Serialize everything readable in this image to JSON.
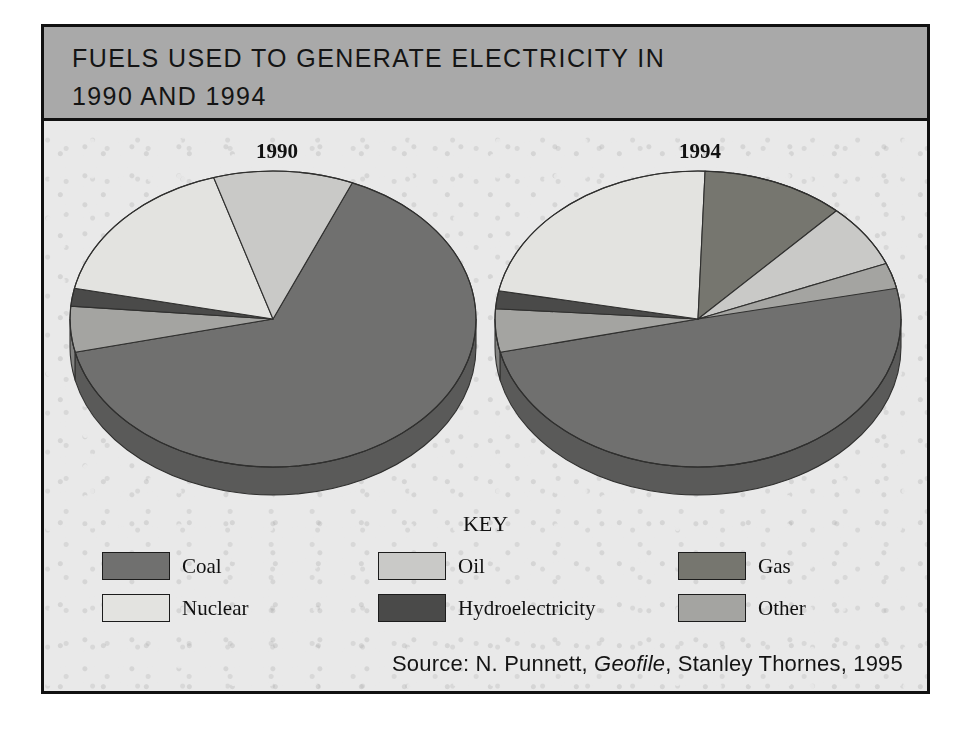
{
  "figure": {
    "title_line_1": "FUELS USED TO GENERATE ELECTRICITY IN",
    "title_line_2": "1990 AND 1994",
    "key_title": "KEY",
    "source_prefix": "Source: N. Punnett, ",
    "source_italic": "Geofile",
    "source_suffix": ", Stanley Thornes, 1995",
    "banner_color": "#a9a9a9",
    "background_color": "#e9e9e9",
    "border_color": "#111111"
  },
  "legend": {
    "entries": [
      {
        "label": "Coal",
        "color": "#70706f"
      },
      {
        "label": "Oil",
        "color": "#c9c9c7"
      },
      {
        "label": "Gas",
        "color": "#76766f"
      },
      {
        "label": "Nuclear",
        "color": "#e3e3e0"
      },
      {
        "label": "Hydroelectricity",
        "color": "#4a4a49"
      },
      {
        "label": "Other",
        "color": "#a4a4a1"
      }
    ]
  },
  "chart_data": {
    "type": "pie",
    "title": "FUELS USED TO GENERATE ELECTRICITY IN 1990 AND 1994",
    "source": "Source: N. Punnett, Geofile, Stanley Thornes, 1995",
    "legend_position": "bottom",
    "categories": [
      "Coal",
      "Oil",
      "Gas",
      "Nuclear",
      "Hydroelectricity",
      "Other"
    ],
    "colors": [
      "#70706f",
      "#c9c9c7",
      "#76766f",
      "#e3e3e0",
      "#4a4a49",
      "#a4a4a1"
    ],
    "units": "percent",
    "charts": [
      {
        "name": "1990",
        "label": "1990",
        "slices": [
          {
            "category": "Coal",
            "value": 65
          },
          {
            "category": "Oil",
            "value": 11
          },
          {
            "category": "Gas",
            "value": 0
          },
          {
            "category": "Nuclear",
            "value": 17
          },
          {
            "category": "Hydroelectricity",
            "value": 2
          },
          {
            "category": "Other",
            "value": 5
          }
        ]
      },
      {
        "name": "1994",
        "label": "1994",
        "slices": [
          {
            "category": "Coal",
            "value": 52
          },
          {
            "category": "Other",
            "value": 2
          },
          {
            "category": "Oil",
            "value": 9
          },
          {
            "category": "Gas",
            "value": 11
          },
          {
            "category": "Nuclear",
            "value": 24
          },
          {
            "category": "Hydroelectricity",
            "value": 2
          }
        ]
      }
    ]
  },
  "pies": {
    "p1990": {
      "label": "1990",
      "slices": [
        {
          "name": "coal",
          "color": "#70706f",
          "start": -67,
          "end": 167
        },
        {
          "name": "other",
          "color": "#a4a4a1",
          "start": 167,
          "end": 185
        },
        {
          "name": "hydro",
          "color": "#4a4a49",
          "start": 185,
          "end": 192
        },
        {
          "name": "nuclear",
          "color": "#e3e3e0",
          "start": 192,
          "end": 253
        },
        {
          "name": "oil",
          "color": "#c9c9c7",
          "start": 253,
          "end": 293
        }
      ]
    },
    "p1994": {
      "label": "1994",
      "slices": [
        {
          "name": "coal",
          "color": "#70706f",
          "start": -80,
          "end": 167
        },
        {
          "name": "other",
          "color": "#a4a4a1",
          "start": 167,
          "end": 184
        },
        {
          "name": "hydro",
          "color": "#4a4a49",
          "start": 184,
          "end": 191
        },
        {
          "name": "nuclear",
          "color": "#e3e3e0",
          "start": 191,
          "end": 272
        },
        {
          "name": "gas",
          "color": "#76766f",
          "start": 272,
          "end": 313
        },
        {
          "name": "oil",
          "color": "#c9c9c7",
          "start": 313,
          "end": 338
        },
        {
          "name": "other2",
          "color": "#a4a4a1",
          "start": 338,
          "end": 348
        }
      ]
    }
  }
}
